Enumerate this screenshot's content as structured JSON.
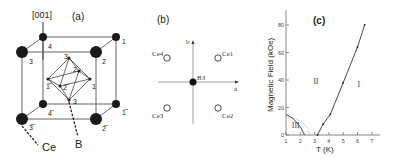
{
  "figure": {
    "panel_a": {
      "label": "(a)",
      "direction": "[001]",
      "atom_labels": {
        "ce": "Ce",
        "b": "B"
      },
      "site_numbers": {
        "top_back_left": "4",
        "top_back_right": "1",
        "top_front_left": "3",
        "top_front_right": "2",
        "bot_back_left": "4̅",
        "bot_back_right": "1̅",
        "bot_front_left": "3̅",
        "bot_front_right": "2̅",
        "oct_top": "3",
        "oct_back": "2",
        "oct_left": "1̅",
        "oct_right": "1",
        "oct_front": "2̅",
        "oct_bottom": "3"
      }
    },
    "panel_b": {
      "label": "(b)",
      "axis_a": "a",
      "axis_b": "b",
      "center": "B3",
      "sites": [
        "Ce1",
        "Ce2",
        "Ce3",
        "Ce4"
      ]
    },
    "panel_c": {
      "label": "(c)"
    }
  },
  "chart_data": {
    "type": "line",
    "title": "(c)",
    "xlabel": "T (K)",
    "ylabel": "Magnetic Field (kOe)",
    "xlim": [
      1,
      7.5
    ],
    "ylim": [
      0,
      90
    ],
    "xticks": [
      1,
      2,
      3,
      4,
      5,
      6,
      7
    ],
    "yticks": [
      0,
      20,
      40,
      60,
      80
    ],
    "grid": false,
    "series": [
      {
        "name": "Phase I/II boundary",
        "x": [
          3.2,
          3.6,
          4.1,
          5.0,
          6.0,
          6.5
        ],
        "y": [
          0,
          8,
          15,
          38,
          64,
          80
        ]
      },
      {
        "name": "Phase III boundary",
        "x": [
          1.0,
          1.5,
          2.0,
          2.3
        ],
        "y": [
          15,
          12,
          6,
          0
        ]
      }
    ],
    "annotations": [
      {
        "text": "I",
        "x": 6.0,
        "y": 35
      },
      {
        "text": "II",
        "x": 2.9,
        "y": 37
      },
      {
        "text": "III",
        "x": 1.4,
        "y": 5
      }
    ]
  }
}
